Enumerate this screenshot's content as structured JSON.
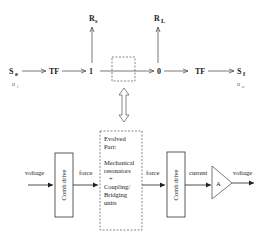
{
  "bond_graph": {
    "source_effort": {
      "label": "S",
      "subscript": "e",
      "input": "u",
      "input_sub": "i"
    },
    "tf_left": "TF",
    "junction_1": "1",
    "junction_0": "0",
    "tf_right": "TF",
    "source_flow": {
      "label": "S",
      "subscript": "f",
      "output": "u",
      "output_sub": "o"
    },
    "resistor_s": {
      "label": "R",
      "subscript": "s"
    },
    "resistor_l": {
      "label": "R",
      "subscript": "L"
    }
  },
  "physical": {
    "input_label": "voltage",
    "comb_drive_left": "Comb drive",
    "force_left": "force",
    "evolved_part": [
      "Evolved",
      "Part:",
      "",
      "Mechanical",
      "resonators",
      "+",
      "Coupling/",
      "Bridging",
      "units"
    ],
    "force_right": "force",
    "comb_drive_right": "Comb drive",
    "current_label": "current",
    "amplifier": "A",
    "output_label": "voltage"
  }
}
